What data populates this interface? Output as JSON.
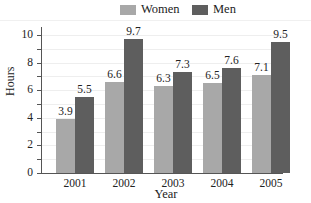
{
  "chart_data": {
    "type": "bar",
    "title": "",
    "xlabel": "Year",
    "ylabel": "Hours",
    "categories": [
      "2001",
      "2002",
      "2003",
      "2004",
      "2005"
    ],
    "series": [
      {
        "name": "Women",
        "color": "#a8a8a8",
        "values": [
          3.9,
          6.6,
          6.3,
          6.5,
          7.1
        ]
      },
      {
        "name": "Men",
        "color": "#5e5e5e",
        "values": [
          5.5,
          9.7,
          7.3,
          7.6,
          9.5
        ]
      }
    ],
    "ylim": [
      0,
      10
    ],
    "yticks": [
      0,
      2,
      4,
      6,
      8,
      10
    ],
    "yticks_minor": [
      1,
      3,
      5,
      7,
      9
    ],
    "grid": true,
    "legend_position": "top",
    "data_labels": true
  },
  "legend": {
    "women_label": "Women",
    "men_label": "Men"
  },
  "axis": {
    "x_title": "Year",
    "y_title": "Hours"
  }
}
